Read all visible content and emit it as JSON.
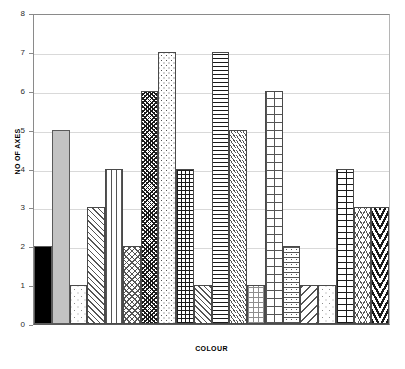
{
  "chart_data": {
    "type": "bar",
    "title": "",
    "xlabel": "COLOUR",
    "ylabel": "NO OF AXES",
    "ylim": [
      0,
      8
    ],
    "yticks": [
      0,
      1,
      2,
      3,
      4,
      5,
      6,
      7,
      8
    ],
    "ytick_labels": [
      "0",
      "1",
      "2",
      "3",
      "4",
      "5",
      "6",
      "7",
      "8"
    ],
    "grid": true,
    "legend": "none",
    "categories": [
      "1",
      "2",
      "3",
      "4",
      "5",
      "6",
      "7",
      "8",
      "9",
      "10",
      "11",
      "12",
      "13",
      "14",
      "15",
      "16",
      "17",
      "18",
      "19",
      "20"
    ],
    "values": [
      2,
      5,
      1,
      3,
      4,
      2,
      6,
      7,
      4,
      1,
      7,
      5,
      1,
      6,
      2,
      1,
      1,
      4,
      3,
      3
    ],
    "bars": [
      {
        "value": 2,
        "pattern": "solid-black",
        "fill": "#000000"
      },
      {
        "value": 5,
        "pattern": "solid-gray",
        "fill": "#c0c0c0"
      },
      {
        "value": 1,
        "pattern": "sparse-dots",
        "fill": "#ffffff"
      },
      {
        "value": 3,
        "pattern": "diagonal-hatch-right",
        "fill": "#ffffff"
      },
      {
        "value": 4,
        "pattern": "vertical-lines",
        "fill": "#ffffff"
      },
      {
        "value": 2,
        "pattern": "fine-crosshatch-diagonal",
        "fill": "#ffffff"
      },
      {
        "value": 6,
        "pattern": "dense-diagonal-weave",
        "fill": "#ffffff"
      },
      {
        "value": 7,
        "pattern": "light-speckle-dots",
        "fill": "#ffffff"
      },
      {
        "value": 4,
        "pattern": "small-grid-waffle",
        "fill": "#ffffff"
      },
      {
        "value": 1,
        "pattern": "diagonal-hatch-right",
        "fill": "#ffffff"
      },
      {
        "value": 7,
        "pattern": "horizontal-lines",
        "fill": "#ffffff"
      },
      {
        "value": 5,
        "pattern": "small-diagonal-dashes",
        "fill": "#ffffff"
      },
      {
        "value": 1,
        "pattern": "faint-dotted-grid",
        "fill": "#ffffff"
      },
      {
        "value": 6,
        "pattern": "large-grid",
        "fill": "#ffffff"
      },
      {
        "value": 2,
        "pattern": "dashed-horizontal-dots",
        "fill": "#ffffff"
      },
      {
        "value": 1,
        "pattern": "wide-diagonal-hatch-left",
        "fill": "#ffffff"
      },
      {
        "value": 1,
        "pattern": "sparse-dots",
        "fill": "#ffffff"
      },
      {
        "value": 4,
        "pattern": "brick",
        "fill": "#ffffff"
      },
      {
        "value": 3,
        "pattern": "scales-fishnet",
        "fill": "#ffffff"
      },
      {
        "value": 3,
        "pattern": "herringbone-zigzag",
        "fill": "#ffffff"
      }
    ],
    "colors": {
      "axis": "#5a5a5a",
      "grid": "#d9d9d9",
      "bar_outline": "#4a4a4a",
      "text": "#000000",
      "background": "#ffffff"
    }
  }
}
